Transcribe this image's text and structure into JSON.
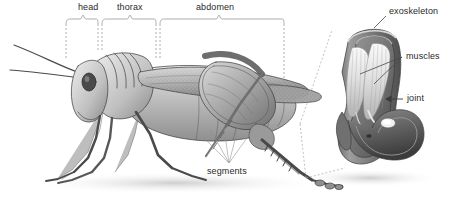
{
  "figure": {
    "style": "grayscale pencil/airbrush scientific illustration",
    "background_color": "#ffffff",
    "line_color": "#2a2a2a",
    "leader_color": "#8d8d8d",
    "text_color": "#2a2a2a",
    "width": 449,
    "height": 203
  },
  "body_labels": [
    {
      "id": "head",
      "text": "head",
      "x": 78,
      "y": 3,
      "brace_from": 66,
      "brace_to": 99
    },
    {
      "id": "thorax",
      "text": "thorax",
      "x": 122,
      "y": 3,
      "brace_from": 101,
      "brace_to": 157
    },
    {
      "id": "abdomen",
      "text": "abdomen",
      "x": 196,
      "y": 3,
      "brace_from": 159,
      "brace_to": 285
    }
  ],
  "callout_labels": [
    {
      "id": "segments",
      "text": "segments",
      "x": 229,
      "y": 168,
      "anchor": "top"
    },
    {
      "id": "exoskeleton",
      "text": "exoskeleton",
      "x": 389,
      "y": 7,
      "anchor": "left"
    },
    {
      "id": "muscles",
      "text": "muscles",
      "x": 405,
      "y": 52,
      "anchor": "left"
    },
    {
      "id": "joint",
      "text": "joint",
      "x": 406,
      "y": 95,
      "anchor": "left"
    }
  ],
  "inset": {
    "name": "leg-joint-cutaway",
    "description": "Cutaway of grasshopper hind leg joint showing exoskeleton shell, internal muscle fibers and the joint pivot",
    "parts": [
      "exoskeleton",
      "muscles",
      "joint"
    ]
  },
  "connectors": {
    "magnify_from_x": 300,
    "magnify_from_y": 125,
    "magnify_to_x": 330,
    "magnify_to_y": 30
  }
}
